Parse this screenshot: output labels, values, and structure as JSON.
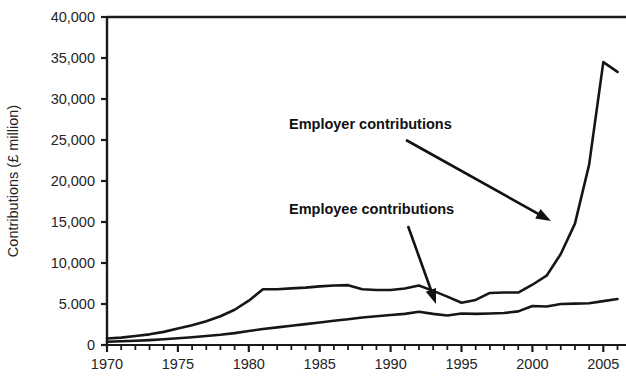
{
  "chart_data": {
    "type": "line",
    "title": "",
    "xlabel": "",
    "ylabel": "Contributions (£ million)",
    "xlim": [
      1970,
      2006.6
    ],
    "ylim": [
      0,
      40000
    ],
    "grid": false,
    "legend_position": "inline-annotations",
    "ytick_values": [
      0,
      5000,
      10000,
      15000,
      20000,
      25000,
      30000,
      35000,
      40000
    ],
    "ytick_labels": [
      "0",
      "5.000",
      "10,000",
      "15,000",
      "20,000",
      "25,000",
      "30,000",
      "35,000",
      "40,000"
    ],
    "xtick_labels": [
      "1970",
      "1975",
      "1980",
      "1985",
      "1990",
      "1995",
      "2000",
      "2005"
    ],
    "xtick_values": [
      1970,
      1975,
      1980,
      1985,
      1990,
      1995,
      2000,
      2005
    ],
    "x_minor_tick_interval": 1,
    "x": [
      1970,
      1971,
      1972,
      1973,
      1974,
      1975,
      1976,
      1977,
      1978,
      1979,
      1980,
      1981,
      1982,
      1983,
      1984,
      1985,
      1986,
      1987,
      1988,
      1989,
      1990,
      1991,
      1992,
      1993,
      1994,
      1995,
      1996,
      1997,
      1998,
      1999,
      2000,
      2001,
      2002,
      2003,
      2004,
      2005,
      2006
    ],
    "series": [
      {
        "name": "Employer contributions",
        "values": [
          800,
          900,
          1100,
          1300,
          1600,
          2000,
          2400,
          2900,
          3500,
          4300,
          5400,
          6800,
          6800,
          6900,
          7000,
          7150,
          7250,
          7300,
          6800,
          6700,
          6700,
          6900,
          7250,
          6600,
          5900,
          5150,
          5500,
          6350,
          6400,
          6400,
          7350,
          8450,
          11100,
          14800,
          22000,
          34500,
          33300
        ]
      },
      {
        "name": "Employee contributions",
        "values": [
          400,
          450,
          520,
          600,
          700,
          820,
          950,
          1100,
          1250,
          1450,
          1700,
          1950,
          2150,
          2350,
          2550,
          2750,
          2950,
          3150,
          3350,
          3500,
          3650,
          3800,
          4050,
          3800,
          3600,
          3850,
          3800,
          3850,
          3900,
          4100,
          4750,
          4700,
          5000,
          5050,
          5100,
          5350,
          5600
        ]
      }
    ],
    "annotations": [
      {
        "text": "Employer contributions",
        "label_x": 289,
        "label_y": 129,
        "arrow_from_x": 406,
        "arrow_from_y": 140,
        "arrow_to_x": 551,
        "arrow_to_y": 221
      },
      {
        "text": "Employee contributions",
        "label_x": 289,
        "label_y": 214,
        "arrow_from_x": 408,
        "arrow_from_y": 226,
        "arrow_to_x": 436,
        "arrow_to_y": 304
      }
    ],
    "colors": {
      "line": "#161616",
      "axis": "#1b1b1b",
      "text": "#252525",
      "background": "#ffffff"
    }
  }
}
